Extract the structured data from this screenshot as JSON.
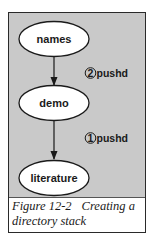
{
  "diagram": {
    "nodes": [
      {
        "id": "names",
        "label": "names",
        "cx": 45,
        "cy": 26
      },
      {
        "id": "demo",
        "label": "demo",
        "cx": 45,
        "cy": 90
      },
      {
        "id": "literature",
        "label": "literature",
        "cx": 45,
        "cy": 165
      }
    ],
    "edges": [
      {
        "from": "names",
        "to": "demo"
      },
      {
        "from": "demo",
        "to": "literature"
      }
    ],
    "steps": [
      {
        "number": "2",
        "command": "pushd",
        "attached_edge": "names-demo"
      },
      {
        "number": "1",
        "command": "pushd",
        "attached_edge": "demo-literature"
      }
    ],
    "colors": {
      "panel_background": "#c9c9c9",
      "node_fill": "#ffffff",
      "stroke": "#1a1a1a"
    }
  },
  "caption": {
    "figure_number": "Figure 12-2",
    "title_line1": "Creating a",
    "title_line2": "directory stack"
  }
}
